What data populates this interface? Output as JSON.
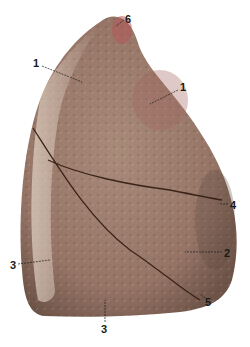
{
  "figure": {
    "colors": {
      "tissue_base": "#a88a78",
      "tissue_light": "#d2c0ae",
      "tissue_dark": "#7d6255",
      "apex_red": "#b5575a",
      "fissure": "#3a2418",
      "label_text": "#1a1a1a"
    },
    "labels": [
      {
        "id": "1a",
        "text": "1",
        "x": 33,
        "y": 58
      },
      {
        "id": "1b",
        "text": "1",
        "x": 180,
        "y": 82
      },
      {
        "id": "6",
        "text": "6",
        "x": 125,
        "y": 14
      },
      {
        "id": "4",
        "text": "4",
        "x": 230,
        "y": 200
      },
      {
        "id": "2",
        "text": "2",
        "x": 224,
        "y": 248
      },
      {
        "id": "3a",
        "text": "3",
        "x": 10,
        "y": 260
      },
      {
        "id": "5",
        "text": "5",
        "x": 205,
        "y": 297
      },
      {
        "id": "3b",
        "text": "3",
        "x": 101,
        "y": 324
      }
    ]
  }
}
